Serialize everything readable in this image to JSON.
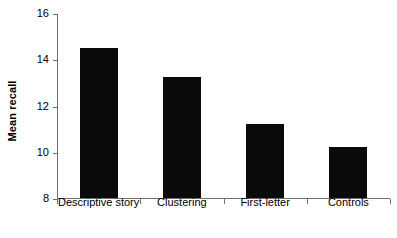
{
  "chart_data": {
    "type": "bar",
    "title": "",
    "xlabel": "",
    "ylabel": "Mean recall",
    "categories": [
      "Descriptive story",
      "Clustering",
      "First-letter",
      "Controls"
    ],
    "values": [
      14.5,
      13.25,
      11.2,
      10.2
    ],
    "ylim": [
      8,
      16
    ],
    "yticks": [
      8,
      10,
      12,
      14,
      16
    ],
    "ytick_labels": [
      "8",
      "10",
      "12",
      "14",
      "16"
    ],
    "grid": false,
    "legend": null,
    "bar_color": "#0a0a0a",
    "axis_color": "#6e6e6e",
    "background_color": "#ffffff"
  }
}
